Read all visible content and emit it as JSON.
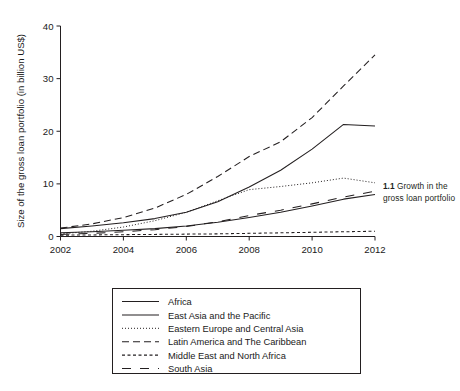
{
  "caption": {
    "number": "1.1",
    "text": "Growth in the gross loan portfolio"
  },
  "chart_data": {
    "type": "line",
    "title": "",
    "xlabel": "",
    "ylabel": "Size of the gross loan portfolio (in billion US$)",
    "xlim": [
      2002,
      2012
    ],
    "ylim": [
      0,
      40
    ],
    "xticks": [
      2002,
      2004,
      2006,
      2008,
      2010,
      2012
    ],
    "xtick_labels": [
      "2002",
      "2004",
      "2006",
      "2008",
      "2010",
      "2012"
    ],
    "yticks": [
      0,
      10,
      20,
      30,
      40
    ],
    "ytick_labels": [
      "0",
      "10",
      "20",
      "30",
      "40"
    ],
    "grid": false,
    "legend_position": "bottom",
    "x": [
      2002,
      2003,
      2004,
      2005,
      2006,
      2007,
      2008,
      2009,
      2010,
      2011,
      2012
    ],
    "series": [
      {
        "name": "Africa",
        "style": "solid",
        "values": [
          0.7,
          0.9,
          1.2,
          1.5,
          2.0,
          2.7,
          3.6,
          4.6,
          5.8,
          7.1,
          8.0
        ]
      },
      {
        "name": "East Asia and the Pacific",
        "style": "solid",
        "values": [
          1.5,
          2.0,
          2.6,
          3.4,
          4.6,
          6.6,
          9.4,
          12.6,
          16.6,
          21.3,
          21.0
        ]
      },
      {
        "name": "Eastern Europe and Central Asia",
        "style": "dotted",
        "values": [
          0.5,
          1.0,
          1.8,
          3.0,
          4.6,
          6.8,
          8.9,
          9.5,
          10.2,
          11.1,
          10.2
        ]
      },
      {
        "name": "Latin America and The Caribbean",
        "style": "dashed-long",
        "values": [
          1.6,
          2.4,
          3.6,
          5.4,
          8.0,
          11.4,
          15.2,
          18.0,
          22.6,
          28.6,
          34.5
        ]
      },
      {
        "name": "Middle East and North Africa",
        "style": "dashed-short",
        "values": [
          0.25,
          0.3,
          0.35,
          0.4,
          0.45,
          0.5,
          0.6,
          0.7,
          0.8,
          0.9,
          1.0
        ]
      },
      {
        "name": "South Asia",
        "style": "dashed-gap",
        "values": [
          0.4,
          0.6,
          0.9,
          1.3,
          1.9,
          2.8,
          4.0,
          5.0,
          6.2,
          7.5,
          8.6
        ]
      }
    ]
  },
  "legend": {
    "items": [
      {
        "label": "Africa",
        "style": "solid"
      },
      {
        "label": "East Asia and the Pacific",
        "style": "solid"
      },
      {
        "label": "Eastern Europe and Central Asia",
        "style": "dotted"
      },
      {
        "label": "Latin America and The Caribbean",
        "style": "dashed-long"
      },
      {
        "label": "Middle East and North Africa",
        "style": "dashed-short"
      },
      {
        "label": "South Asia",
        "style": "dashed-gap"
      }
    ]
  },
  "colors": {
    "line": "#231f20",
    "axis": "#231f20",
    "text": "#1a1a1a",
    "background": "#ffffff"
  }
}
